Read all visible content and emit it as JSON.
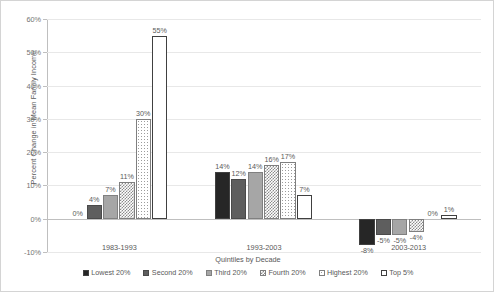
{
  "chart_data": {
    "type": "bar",
    "title": "",
    "xlabel": "Quintiles by Decade",
    "ylabel": "Percent Change in Mean Family Income",
    "ylim": [
      -10,
      60
    ],
    "ytick_labels": [
      "60%",
      "50%",
      "40%",
      "30%",
      "20%",
      "10%",
      "0%",
      "-10%"
    ],
    "ytick_values": [
      60,
      50,
      40,
      30,
      20,
      10,
      0,
      -10
    ],
    "grid": true,
    "legend_position": "bottom",
    "categories": [
      "1983-1993",
      "1993-2003",
      "2003-2013"
    ],
    "series": [
      {
        "name": "Lowest 20%",
        "values": [
          0,
          14,
          -8
        ],
        "labels": [
          "0%",
          "14%",
          "-8%"
        ],
        "pattern": "solid-dark"
      },
      {
        "name": "Second 20%",
        "values": [
          4,
          12,
          -5
        ],
        "labels": [
          "4%",
          "12%",
          "-5%"
        ],
        "pattern": "solid-mid"
      },
      {
        "name": "Third 20%",
        "values": [
          7,
          14,
          -5
        ],
        "labels": [
          "7%",
          "14%",
          "-5%"
        ],
        "pattern": "solid-light"
      },
      {
        "name": "Fourth 20%",
        "values": [
          11,
          16,
          -4
        ],
        "labels": [
          "11%",
          "16%",
          "-4%"
        ],
        "pattern": "checker"
      },
      {
        "name": "Highest 20%",
        "values": [
          30,
          17,
          0
        ],
        "labels": [
          "30%",
          "17%",
          "0%"
        ],
        "pattern": "dots"
      },
      {
        "name": "Top 5%",
        "values": [
          55,
          7,
          1
        ],
        "labels": [
          "55%",
          "7%",
          "1%"
        ],
        "pattern": "white"
      }
    ]
  },
  "colors": {
    "solid_dark": "#262626",
    "solid_mid": "#5e5e5e",
    "solid_light": "#a6a6a6",
    "outline": "#404040",
    "gridline": "#e8e8e8",
    "axis": "#bfbfbf",
    "text": "#595959"
  }
}
